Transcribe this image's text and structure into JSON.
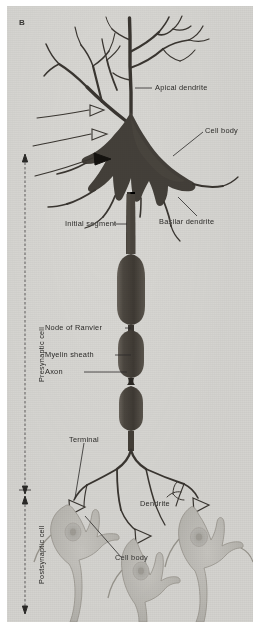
{
  "figure": {
    "panel_letter": "B",
    "background_color": "#d9d8d4",
    "ink_color": "#3a3631",
    "soma_fill": "#4a453f",
    "postsynaptic_fill": "#c3c1bc",
    "caption_font_size_px": 7.4
  },
  "labels": {
    "apical_dendrite": "Apical dendrite",
    "cell_body_top": "Cell body",
    "basilar_dendrite": "Basilar dendrite",
    "initial_segment": "Initial segment",
    "node_of_ranvier": "Node of Ranvier",
    "myelin_sheath": "Myelin sheath",
    "axon": "Axon",
    "terminal": "Terminal",
    "dendrite": "Dendrite",
    "cell_body_bottom": "Cell body"
  },
  "brackets": {
    "presynaptic": "Presynaptic cell",
    "postsynaptic": "Postsynaptic cell"
  },
  "structures": {
    "myelin_segment_count": 3,
    "node_count": 2,
    "postsynaptic_cell_count": 3,
    "axosomatic_synapse_count": 3,
    "filled_synapse_count": 1,
    "open_synapse_count": 2,
    "terminal_bouton_count": 3
  }
}
